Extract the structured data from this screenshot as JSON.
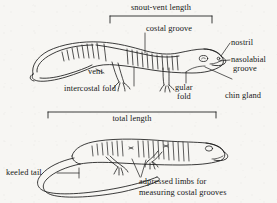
{
  "figure": {
    "background_color": "#f7f6f3",
    "ink_color": "#1a1a1a"
  },
  "measurements": {
    "snout_vent": {
      "label": "snout-vent length",
      "bracket_x1": 110,
      "bracket_x2": 212,
      "bracket_y": 16
    },
    "total": {
      "label": "total length",
      "bracket_x1": 48,
      "bracket_x2": 216,
      "bracket_y": 112
    }
  },
  "upper_specimen": {
    "name": "lateral-view-salamander",
    "labels": [
      {
        "key": "costal_groove",
        "text": "costal groove"
      },
      {
        "key": "nostril",
        "text": "nostril"
      },
      {
        "key": "nasolabial_groove",
        "text": "nasolabial\ngroove"
      },
      {
        "key": "vent",
        "text": "vent"
      },
      {
        "key": "intercostal_fold",
        "text": "intercostal fold"
      },
      {
        "key": "gular_fold",
        "text": "gular\nfold"
      },
      {
        "key": "chin_gland",
        "text": "chin gland"
      }
    ]
  },
  "lower_specimen": {
    "name": "curved-salamander-adpressed-limbs",
    "labels": [
      {
        "key": "keeled_tail",
        "text": "keeled tail"
      },
      {
        "key": "adpressed_limbs",
        "text": "adpressed limbs for\nmeasuring costal grooves"
      }
    ]
  },
  "text": {
    "snout_vent_length": "snout-vent length",
    "costal_groove": "costal groove",
    "nostril": "nostril",
    "nasolabial_groove_l1": "nasolabial",
    "nasolabial_groove_l2": "groove",
    "vent": "vent",
    "intercostal_fold": "intercostal fold",
    "gular_l1": "gular",
    "gular_l2": "fold",
    "chin_gland": "chin gland",
    "total_length": "total length",
    "keeled_tail": "keeled tail",
    "adpressed_l1": "adpressed limbs for",
    "adpressed_l2": "measuring costal grooves"
  }
}
